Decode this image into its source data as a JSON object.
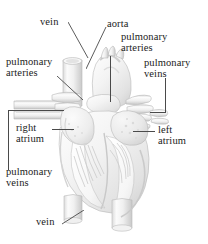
{
  "figure": {
    "style": "grayscale pencil / airbrush medical illustration with cutaway of the ventricles",
    "width": 208,
    "height": 244,
    "background_color": "#ffffff",
    "line_color": "#4a4a4a",
    "text_color": "#1b1b1b",
    "illustration_fill": "#f2f2f2",
    "illustration_shadow": "#d2d2d2"
  },
  "labels": {
    "vein_top": "vein",
    "pulmonary_arteries_left": "pulmonary\narteries",
    "aorta": "aorta",
    "pulmonary_arteries_right": "pulmonary\narteries",
    "pulmonary_veins_right": "pulmonary\nveins",
    "right_atrium": "right\natrium",
    "left_atrium": "left\natrium",
    "pulmonary_veins_left": "pulmonary\nveins",
    "vein_bottom": "vein"
  }
}
